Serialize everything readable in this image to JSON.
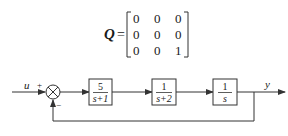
{
  "matrix": {
    "symbol": "Q",
    "equals": "=",
    "rows": [
      [
        "0",
        "0",
        "0"
      ],
      [
        "0",
        "0",
        "0"
      ],
      [
        "0",
        "0",
        "1"
      ]
    ]
  },
  "block_diagram": {
    "input_label": "u",
    "output_label": "y",
    "summing_junction": {
      "plus_sign": "+",
      "minus_sign": "−"
    },
    "blocks": [
      {
        "numerator": "5",
        "denominator": "s+1"
      },
      {
        "numerator": "1",
        "denominator": "s+2"
      },
      {
        "numerator": "1",
        "denominator": "s"
      }
    ],
    "feedback": "unity negative feedback from y to summing junction"
  },
  "colors": {
    "line": "#333333",
    "background": "#ffffff"
  }
}
